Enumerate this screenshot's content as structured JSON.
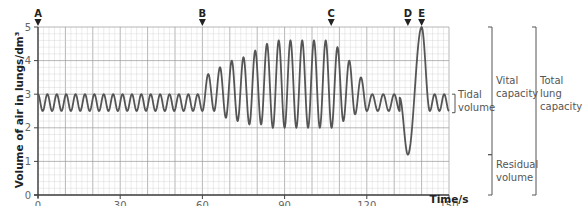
{
  "chart_data": {
    "type": "line",
    "title": "",
    "xlabel": "Time/s",
    "ylabel": "Volume of air in lungs/dm³",
    "xlim": [
      0,
      150
    ],
    "ylim": [
      0,
      5
    ],
    "xticks": [
      0,
      30,
      60,
      90,
      120,
      150
    ],
    "yticks": [
      0,
      1,
      2,
      3,
      4,
      5
    ],
    "grid": true,
    "markers": [
      {
        "label": "A",
        "x": 0
      },
      {
        "label": "B",
        "x": 60
      },
      {
        "label": "C",
        "x": 107
      },
      {
        "label": "D",
        "x": 135
      },
      {
        "label": "E",
        "x": 140
      }
    ],
    "segments": [
      {
        "name": "tidal-breathing-1",
        "x_start": 0,
        "x_end": 60,
        "cycles": 17,
        "min": 2.5,
        "max": 3.0
      },
      {
        "name": "deep-breathing",
        "x_start": 60,
        "x_end": 120,
        "peaks": [
          3.6,
          3.8,
          4.0,
          4.1,
          4.3,
          4.5,
          4.6,
          4.6,
          4.6,
          4.6,
          4.6,
          4.4,
          4.0,
          3.5
        ],
        "troughs": [
          2.5,
          2.3,
          2.2,
          2.1,
          2.1,
          2.0,
          2.0,
          2.0,
          2.0,
          2.0,
          2.0,
          2.2,
          2.4,
          2.5
        ]
      },
      {
        "name": "tidal-breathing-2",
        "x_start": 120,
        "x_end": 132,
        "cycles": 3,
        "min": 2.5,
        "max": 3.0
      },
      {
        "name": "forced-exhale-inhale",
        "points": [
          [
            132,
            2.9
          ],
          [
            135,
            1.2
          ],
          [
            140,
            5.0
          ],
          [
            143,
            2.5
          ]
        ]
      },
      {
        "name": "tidal-breathing-3",
        "x_start": 143,
        "x_end": 150,
        "cycles": 2,
        "min": 2.5,
        "max": 3.0
      }
    ],
    "annotations": [
      {
        "label": "Tidal volume",
        "y_range": [
          2.5,
          3.0
        ]
      },
      {
        "label": "Vital capacity",
        "y_range": [
          1.2,
          5.0
        ]
      },
      {
        "label": "Residual volume",
        "y_range": [
          0,
          1.2
        ]
      },
      {
        "label": "Total lung capacity",
        "y_range": [
          0,
          5.0
        ]
      }
    ],
    "annotation_lines": {
      "tidal": [
        "Tidal",
        "volume"
      ],
      "vital": [
        "Vital",
        "capacity"
      ],
      "residual": [
        "Residual",
        "volume"
      ],
      "total": [
        "Total",
        "lung",
        "capacity"
      ]
    },
    "colors": {
      "line": "#555555",
      "grid_minor": "#cfcfcf",
      "grid_major": "#9a9a9a",
      "axis": "#444444"
    }
  }
}
